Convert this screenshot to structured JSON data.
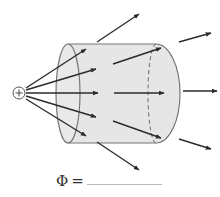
{
  "diagram": {
    "charge": {
      "sign": "+",
      "cx": 19,
      "cy": 93,
      "r": 6
    },
    "cylinder": {
      "fill": "#e6e6e6",
      "stroke": "#777777",
      "left_end": {
        "cx": 68,
        "cy": 93.5,
        "rx": 12,
        "ry": 49.5
      },
      "right_end": {
        "cx": 156,
        "cy": 93.5,
        "rx": 24,
        "ry": 49.5
      },
      "top_y": 44,
      "bottom_y": 143
    },
    "field_lines_color": "#2b2b2b",
    "field_lines_inside": [
      {
        "x1": 26,
        "y1": 88,
        "x2": 86,
        "y2": 49
      },
      {
        "x1": 26,
        "y1": 90,
        "x2": 96,
        "y2": 69
      },
      {
        "x1": 26,
        "y1": 93,
        "x2": 98,
        "y2": 93
      },
      {
        "x1": 26,
        "y1": 96,
        "x2": 96,
        "y2": 117
      },
      {
        "x1": 26,
        "y1": 99,
        "x2": 86,
        "y2": 136
      }
    ],
    "field_lines_continuing": [
      {
        "x1": 113,
        "y1": 64,
        "x2": 161,
        "y2": 48
      },
      {
        "x1": 114,
        "y1": 93,
        "x2": 164,
        "y2": 93
      },
      {
        "x1": 113,
        "y1": 121,
        "x2": 161,
        "y2": 138
      }
    ],
    "field_lines_outside": [
      {
        "x1": 97,
        "y1": 42,
        "x2": 139,
        "y2": 14
      },
      {
        "x1": 179,
        "y1": 42,
        "x2": 211,
        "y2": 33
      },
      {
        "x1": 183,
        "y1": 91,
        "x2": 217,
        "y2": 91
      },
      {
        "x1": 179,
        "y1": 139,
        "x2": 211,
        "y2": 149
      },
      {
        "x1": 97,
        "y1": 142,
        "x2": 139,
        "y2": 170
      }
    ]
  },
  "flux_prompt": {
    "symbol": "Φ",
    "equals": "=",
    "answer": ""
  }
}
